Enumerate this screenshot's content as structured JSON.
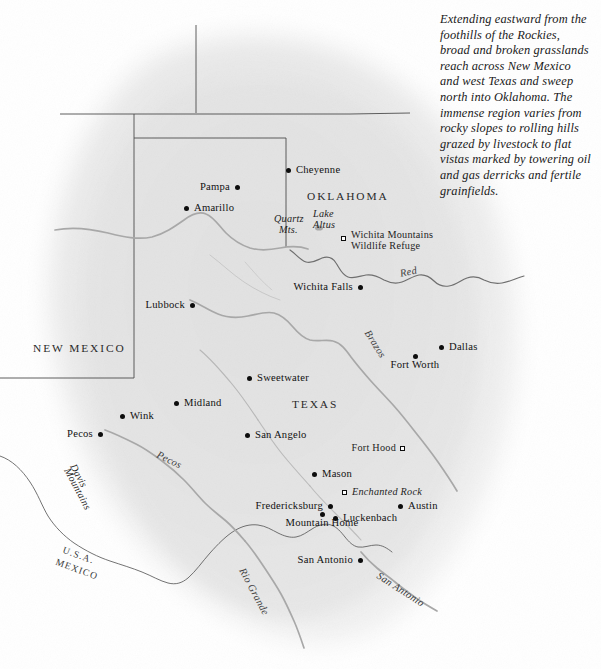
{
  "caption": {
    "text": "Extending eastward from the foothills of the Rockies, broad and broken grasslands reach across New Mexico and west Texas and sweep north into Oklahoma.  The immense region varies from rocky slopes to rolling hills grazed by livestock to flat vistas marked by towering oil and gas derricks and fertile grainfields."
  },
  "colors": {
    "page_background": "#ffffff",
    "land_fill": "#e7e7e7",
    "land_fill_light": "#efefef",
    "river": "#a9a9a9",
    "state_border": "#4a4a4a",
    "national_border": "#555555",
    "label_text": "#111111",
    "dot_fill": "#0d0d0d"
  },
  "states": [
    {
      "name": "NEW  MEXICO",
      "x": 33,
      "y": 348
    },
    {
      "name": "OKLAHOMA",
      "x": 307,
      "y": 196
    },
    {
      "name": "TEXAS",
      "x": 292,
      "y": 404
    }
  ],
  "cities": [
    {
      "name": "Cheyenne",
      "dot_x": 288,
      "dot_y": 170,
      "label_x": 296,
      "label_y": 165,
      "anchor": "left"
    },
    {
      "name": "Pampa",
      "dot_x": 237,
      "dot_y": 187,
      "label_x": 230,
      "label_y": 182,
      "anchor": "right"
    },
    {
      "name": "Amarillo",
      "dot_x": 186,
      "dot_y": 208,
      "label_x": 194,
      "label_y": 203,
      "anchor": "left"
    },
    {
      "name": "Wichita Falls",
      "dot_x": 360,
      "dot_y": 287,
      "label_x": 353,
      "label_y": 282,
      "anchor": "right"
    },
    {
      "name": "Lubbock",
      "dot_x": 192,
      "dot_y": 305,
      "label_x": 185,
      "label_y": 300,
      "anchor": "right"
    },
    {
      "name": "Dallas",
      "dot_x": 441,
      "dot_y": 347,
      "label_x": 449,
      "label_y": 342,
      "anchor": "left"
    },
    {
      "name": "Fort Worth",
      "dot_x": 415,
      "dot_y": 356,
      "label_x": 415,
      "label_y": 359,
      "anchor": "center"
    },
    {
      "name": "Sweetwater",
      "dot_x": 249,
      "dot_y": 378,
      "label_x": 257,
      "label_y": 373,
      "anchor": "left"
    },
    {
      "name": "Midland",
      "dot_x": 176,
      "dot_y": 403,
      "label_x": 184,
      "label_y": 398,
      "anchor": "left"
    },
    {
      "name": "Wink",
      "dot_x": 122,
      "dot_y": 416,
      "label_x": 130,
      "label_y": 411,
      "anchor": "left"
    },
    {
      "name": "Pecos",
      "dot_x": 100,
      "dot_y": 434,
      "label_x": 93,
      "label_y": 429,
      "anchor": "right"
    },
    {
      "name": "San Angelo",
      "dot_x": 247,
      "dot_y": 435,
      "label_x": 255,
      "label_y": 430,
      "anchor": "left"
    },
    {
      "name": "Mason",
      "dot_x": 314,
      "dot_y": 474,
      "label_x": 322,
      "label_y": 469,
      "anchor": "left"
    },
    {
      "name": "Fredericksburg",
      "dot_x": 330,
      "dot_y": 506,
      "label_x": 323,
      "label_y": 501,
      "anchor": "right"
    },
    {
      "name": "Austin",
      "dot_x": 400,
      "dot_y": 506,
      "label_x": 408,
      "label_y": 501,
      "anchor": "left"
    },
    {
      "name": "Mountain Home",
      "dot_x": 322,
      "dot_y": 514,
      "label_x": 322,
      "label_y": 517,
      "anchor": "center"
    },
    {
      "name": "Luckenbach",
      "dot_x": 335,
      "dot_y": 518,
      "label_x": 343,
      "label_y": 513,
      "anchor": "left"
    },
    {
      "name": "San Antonio",
      "dot_x": 360,
      "dot_y": 560,
      "label_x": 353,
      "label_y": 555,
      "anchor": "right"
    }
  ],
  "landmarks": [
    {
      "name": "Wichita Mountains Wildlife Refuge",
      "line1": "Wichita Mountains",
      "line2": "Wildlife Refuge",
      "sq_x": 342,
      "sq_y": 237,
      "label_x": 351,
      "label_y": 230,
      "style": "upright"
    },
    {
      "name": "Fort Hood",
      "line1": "Fort Hood",
      "line2": "",
      "sq_x": 401,
      "sq_y": 447,
      "label_x": 396,
      "label_y": 442,
      "style": "upright-right"
    },
    {
      "name": "Enchanted Rock",
      "line1": "Enchanted Rock",
      "line2": "",
      "sq_x": 343,
      "sq_y": 491,
      "label_x": 352,
      "label_y": 486,
      "style": "italic"
    }
  ],
  "physical_features": [
    {
      "name": "Quartz Mts.",
      "line1": "Quartz",
      "line2": "Mts.",
      "x": 274,
      "y": 219
    },
    {
      "name": "Lake Altus",
      "line1": "Lake",
      "line2": "Altus",
      "x": 313,
      "y": 213
    }
  ],
  "water_labels": [
    {
      "name": "Red",
      "text": "Red",
      "x": 399,
      "y": 268,
      "rotation": -12
    },
    {
      "name": "Brazos",
      "text": "Brazos",
      "x": 372,
      "y": 328,
      "rotation": 58
    },
    {
      "name": "Pecos",
      "text": "Pecos",
      "x": 160,
      "y": 449,
      "rotation": 26
    },
    {
      "name": "Rio Grande",
      "text": "Rio Grande",
      "x": 247,
      "y": 566,
      "rotation": 62
    },
    {
      "name": "San Antonio",
      "text": "San Antonio",
      "x": 381,
      "y": 570,
      "rotation": 33
    }
  ],
  "terrain_labels": [
    {
      "name": "Davis Mountains",
      "line1": "Davis",
      "line2": "Mountains",
      "x": 78,
      "y": 462,
      "rotation": 62
    }
  ],
  "border_labels": [
    {
      "name": "U.S.A.",
      "text": "U.S.A.",
      "x": 65,
      "y": 549,
      "rotation": 20
    },
    {
      "name": "MEXICO",
      "text": "MEXICO",
      "x": 58,
      "y": 561,
      "rotation": 20
    }
  ]
}
